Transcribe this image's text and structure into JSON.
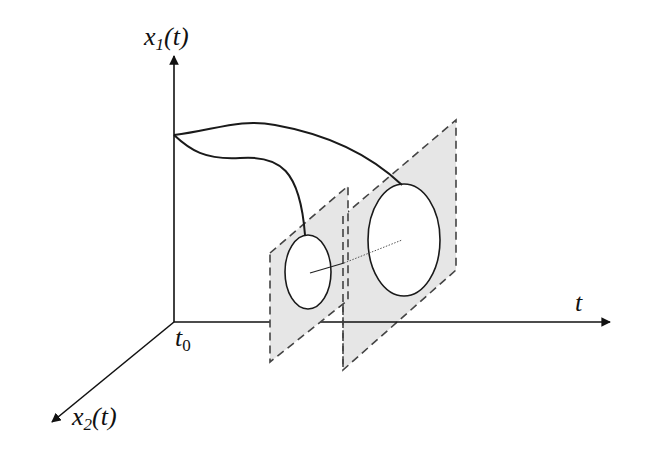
{
  "diagram": {
    "type": "3d-axes-trajectory-tube",
    "axes": {
      "vertical": {
        "label_base": "x",
        "label_sub": "1",
        "label_arg": "(t)"
      },
      "horizontal": {
        "label": "t"
      },
      "depth": {
        "label_base": "x",
        "label_sub": "2",
        "label_arg": "(t)"
      },
      "origin": {
        "label_base": "t",
        "label_sub": "0"
      }
    },
    "planes": [
      {
        "name": "near-section-plane",
        "fill": "#e6e6e6",
        "border": "dashed"
      },
      {
        "name": "far-section-plane",
        "fill": "#e6e6e6",
        "border": "dashed"
      }
    ],
    "colors": {
      "stroke": "#1a1a1a",
      "plane_fill": "#e6e6e6",
      "plane_border": "#444444",
      "background": "#ffffff"
    }
  }
}
